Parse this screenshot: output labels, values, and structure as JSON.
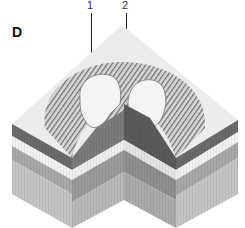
{
  "figure": {
    "panel_label": "D",
    "callouts": [
      {
        "id": "callout-1",
        "label": "1",
        "x": 90,
        "leader_top": 13,
        "leader_bottom": 104
      },
      {
        "id": "callout-2",
        "label": "2",
        "x": 126,
        "leader_top": 13,
        "leader_bottom": 104
      }
    ],
    "colors": {
      "surface": "#ececec",
      "rim_hatch": "#8a8a8a",
      "crater_floor": "#f4f4f4",
      "dark_band": "#6a6a6a",
      "light_band": "#f2f2f2",
      "mid_band": "#a8a8a8",
      "lower_band": "#c4c4c4",
      "cut_face_dark": "#5a5a5a"
    }
  }
}
